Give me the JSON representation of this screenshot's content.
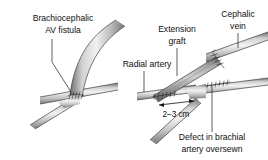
{
  "figure": {
    "background_color": "#ffffff",
    "ink_color": "#101010",
    "vessel_light": "#e8e8e8",
    "vessel_mid": "#b9b9b9",
    "vessel_dark": "#6e6e6e",
    "graft_dark": "#8a8a8a",
    "outline_color": "#4a4a4a"
  },
  "panels": [
    {
      "id": "left-panel",
      "name": "brachiocephalic-av-fistula-panel",
      "labels": [
        {
          "id": "brachiocephalic-av-fistula",
          "line1": "Brachiocephalic",
          "line2": "AV fistula"
        }
      ]
    },
    {
      "id": "right-panel",
      "name": "extension-graft-panel",
      "labels": [
        {
          "id": "extension-graft",
          "line1": "Extension",
          "line2": "graft"
        },
        {
          "id": "cephalic-vein",
          "line1": "Cephalic",
          "line2": "vein"
        },
        {
          "id": "radial-artery",
          "line1": "Radial artery",
          "line2": ""
        },
        {
          "id": "defect-brachial-artery",
          "line1": "Defect in brachial",
          "line2": "artery oversewn"
        }
      ],
      "measurement": {
        "id": "graft-length",
        "text": "2–3 cm"
      }
    }
  ]
}
